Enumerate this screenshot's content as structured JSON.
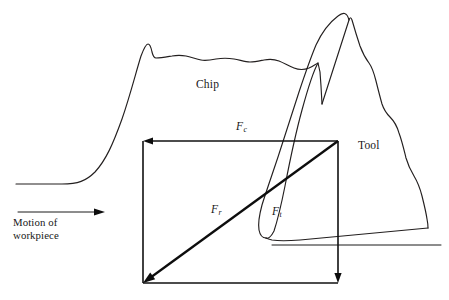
{
  "figure": {
    "background_color": "#ffffff",
    "line_color": "#1a1a1a",
    "width": 449,
    "height": 300
  },
  "labels": {
    "chip": "Chip",
    "tool": "Tool",
    "motion_line1": "Motion of",
    "motion_line2": "workpiece"
  },
  "forces": [
    {
      "id": "cutting",
      "symbol": "F",
      "subscript": "c",
      "name": "cutting force",
      "direction": "left",
      "from": [
        338,
        141
      ],
      "to": [
        143,
        141
      ]
    },
    {
      "id": "thrust",
      "symbol": "F",
      "subscript": "t",
      "name": "thrust force",
      "direction": "down",
      "from": [
        338,
        141
      ],
      "to": [
        338,
        283
      ]
    },
    {
      "id": "resultant",
      "symbol": "F",
      "subscript": "r",
      "name": "resultant force",
      "direction": "down-left",
      "from": [
        338,
        141
      ],
      "to": [
        143,
        283
      ]
    }
  ],
  "geometry": {
    "force_rectangle": {
      "left": 143,
      "top": 141,
      "right": 338,
      "bottom": 283
    },
    "workpiece_surface_y": 184,
    "machined_surface_y": 245,
    "tool_apex": [
      349,
      20
    ],
    "tool_tip": [
      266,
      238
    ],
    "chip_peak": [
      148,
      44
    ]
  },
  "paths": {
    "workpiece_chip_outline": "M 16 184 L 62 184 C 78 184 86 181 95 172 C 106 160 113 144 122 119 C 130 96 136 72 141 56 C 144 48 146 44 148 44 C 150 44 151 47 152 52 C 153 56 154 58 156 58 C 161 58 166 57 172 56 C 177 55 181 55 186 56 C 191 57 196 59 201 60 C 206 61 211 60 216 59 C 222 58 228 58 234 59 C 240 60 245 62 250 62 C 255 62 259 61 264 60 C 269 59 274 59 279 61 C 284 63 289 66 294 68 C 299 70 304 70 309 68 C 313 66 316 64 318 63 L 320 72 L 321 86 L 322 104",
    "chip_right_inner": "M 318 63 C 314 70 308 88 302 110 C 296 132 290 160 285 186 C 281 206 277 222 274 231 C 271 237 268 239 266 238",
    "tool_outline": "M 322 104 L 349 20 C 350 17 351 17 352 20 C 354 27 357 37 360 46 C 363 54 366 59 369 63 C 372 67 374 73 376 81 C 378 89 380 97 382 104 C 384 110 387 114 390 117 C 394 121 397 126 399 133 C 402 141 404 150 406 158 C 408 165 411 171 414 176 C 417 181 420 188 422 196 C 424 204 426 212 427 219 C 428 224 428 227 428 228",
    "tool_flank": "M 428 228 L 300 240 C 288 241 278 241 272 240 C 268 239 266 238 266 238",
    "tool_nose": "M 266 238 C 262 238 260 235 259 230 C 258 224 259 216 262 205 C 266 192 272 175 278 157 C 285 136 292 114 299 92 C 305 74 311 57 316 45 C 322 32 330 22 338 16 C 343 12 347 12 349 20",
    "machined_surface": "M 272 245 L 441 245"
  }
}
